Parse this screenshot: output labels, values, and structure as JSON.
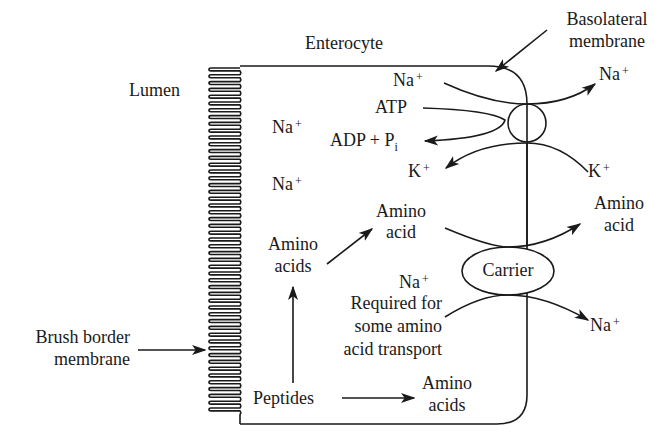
{
  "diagram": {
    "title_cell": "Enterocyte",
    "lumen": "Lumen",
    "brush_border": [
      "Brush border",
      "membrane"
    ],
    "basolateral": [
      "Basolateral",
      "membrane"
    ],
    "pump": {
      "na_in": "Na",
      "na_out": "Na",
      "atp": "ATP",
      "adp": "ADP + P",
      "adp_sub": "i",
      "k_in": "K",
      "k_out": "K",
      "plus": "+"
    },
    "lumen_ions": {
      "na1": "Na",
      "na2": "Na",
      "plus": "+"
    },
    "carrier": {
      "label": "Carrier",
      "aa_in": [
        "Amino",
        "acid"
      ],
      "aa_out": [
        "Amino",
        "acid"
      ],
      "na_in": "Na",
      "na_note": [
        "Required for",
        "some amino",
        "acid transport"
      ],
      "na_out": "Na"
    },
    "digestion": {
      "peptides": "Peptides",
      "amino_acids_up": [
        "Amino",
        "acids"
      ],
      "amino_acids_right": [
        "Amino",
        "acids"
      ]
    },
    "colors": {
      "ink": "#1a1a1a",
      "background": "#ffffff"
    }
  }
}
